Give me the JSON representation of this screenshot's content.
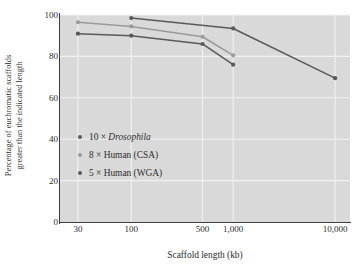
{
  "chart_data": {
    "type": "line",
    "title": "",
    "xlabel": "Scaffold length (kb)",
    "ylabel_line1": "Percentage of euchromatic scaffolds",
    "ylabel_line2": "greater than the indicated length",
    "xscale": "log",
    "xlim": [
      20,
      14000
    ],
    "ylim": [
      0,
      100
    ],
    "grid": true,
    "legend_position": "inside-left",
    "xticks": [
      {
        "value": 30,
        "label": "30"
      },
      {
        "value": 100,
        "label": "100"
      },
      {
        "value": 500,
        "label": "500"
      },
      {
        "value": 1000,
        "label": "1,000"
      },
      {
        "value": 10000,
        "label": "10,000"
      }
    ],
    "yticks": [
      {
        "value": 0,
        "label": "0"
      },
      {
        "value": 20,
        "label": "20"
      },
      {
        "value": 40,
        "label": "40"
      },
      {
        "value": 60,
        "label": "60"
      },
      {
        "value": 80,
        "label": "80"
      },
      {
        "value": 100,
        "label": "100"
      }
    ],
    "series": [
      {
        "name": "10 × Drosophila",
        "label_prefix": "10 × ",
        "label_italic": "Drosophila",
        "label_suffix": "",
        "color": "#595959",
        "x": [
          100,
          1000,
          10000
        ],
        "y": [
          98.5,
          93.5,
          69.5
        ]
      },
      {
        "name": "8 × Human (CSA)",
        "label_prefix": "8 × Human (CSA)",
        "label_italic": "",
        "label_suffix": "",
        "color": "#9a9a9a",
        "x": [
          30,
          100,
          500,
          1000
        ],
        "y": [
          96.5,
          94.5,
          89.5,
          80.5
        ]
      },
      {
        "name": "5 × Human (WGA)",
        "label_prefix": "5 × Human (WGA)",
        "label_italic": "",
        "label_suffix": "",
        "color": "#595959",
        "x": [
          30,
          100,
          500,
          1000
        ],
        "y": [
          91.0,
          90.0,
          86.0,
          76.0
        ]
      }
    ],
    "colors": {
      "plot_background": "#d9d9d9",
      "gridline": "#f2f2f2",
      "axis": "#3c3c3c",
      "text": "#2b2b2b",
      "dark_series": "#595959",
      "light_series": "#9a9a9a"
    }
  }
}
